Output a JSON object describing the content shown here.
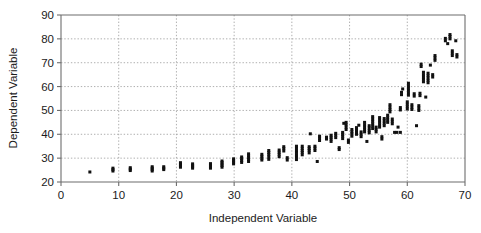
{
  "chart_data": {
    "type": "scatter",
    "title": "",
    "xlabel": "Independent Variable",
    "ylabel": "Dependent Variable",
    "xlim": [
      0,
      70
    ],
    "ylim": [
      20,
      90
    ],
    "xticks": [
      0,
      10,
      20,
      30,
      40,
      50,
      60,
      70
    ],
    "yticks": [
      20,
      30,
      40,
      50,
      60,
      70,
      80,
      90
    ],
    "xtick_labels": [
      "0",
      "10",
      "20",
      "30",
      "40",
      "50",
      "60",
      "70"
    ],
    "ytick_labels": [
      "20",
      "30",
      "40",
      "50",
      "60",
      "70",
      "80",
      "90"
    ],
    "grid": true,
    "grid_style": "dotted",
    "legend": null,
    "marker": "square",
    "marker_color": "#111111",
    "marker_size": 3,
    "series": [
      {
        "name": "observations",
        "points": [
          [
            5.0,
            24.2
          ],
          [
            9.0,
            24.6
          ],
          [
            9.0,
            25.2
          ],
          [
            9.0,
            25.8
          ],
          [
            12.0,
            24.8
          ],
          [
            12.0,
            25.4
          ],
          [
            12.0,
            26.0
          ],
          [
            15.8,
            24.6
          ],
          [
            15.8,
            25.2
          ],
          [
            15.8,
            25.8
          ],
          [
            15.8,
            26.4
          ],
          [
            17.8,
            25.2
          ],
          [
            17.8,
            25.8
          ],
          [
            17.8,
            26.4
          ],
          [
            20.7,
            26.2
          ],
          [
            20.7,
            26.8
          ],
          [
            20.7,
            27.4
          ],
          [
            20.7,
            28.1
          ],
          [
            22.8,
            25.8
          ],
          [
            22.8,
            26.4
          ],
          [
            22.8,
            27.0
          ],
          [
            22.8,
            27.6
          ],
          [
            25.9,
            25.8
          ],
          [
            25.9,
            26.4
          ],
          [
            25.9,
            27.1
          ],
          [
            25.9,
            27.7
          ],
          [
            27.9,
            26.2
          ],
          [
            27.9,
            26.9
          ],
          [
            27.9,
            27.5
          ],
          [
            27.9,
            28.2
          ],
          [
            27.9,
            28.8
          ],
          [
            29.9,
            27.6
          ],
          [
            29.9,
            28.3
          ],
          [
            29.9,
            29.0
          ],
          [
            29.9,
            29.7
          ],
          [
            31.3,
            28.2
          ],
          [
            31.3,
            29.0
          ],
          [
            31.3,
            29.8
          ],
          [
            31.3,
            30.5
          ],
          [
            32.5,
            28.6
          ],
          [
            32.5,
            29.4
          ],
          [
            32.5,
            30.2
          ],
          [
            32.5,
            31.0
          ],
          [
            32.5,
            31.8
          ],
          [
            34.8,
            29.2
          ],
          [
            34.8,
            30.0
          ],
          [
            34.8,
            30.8
          ],
          [
            34.8,
            31.6
          ],
          [
            36.0,
            29.5
          ],
          [
            36.0,
            30.5
          ],
          [
            36.0,
            31.5
          ],
          [
            36.0,
            32.4
          ],
          [
            36.0,
            33.2
          ],
          [
            37.8,
            30.6
          ],
          [
            37.8,
            31.6
          ],
          [
            37.8,
            32.5
          ],
          [
            37.8,
            33.4
          ],
          [
            38.6,
            33.0
          ],
          [
            38.6,
            34.0
          ],
          [
            38.6,
            34.8
          ],
          [
            39.2,
            29.2
          ],
          [
            39.2,
            30.2
          ],
          [
            40.8,
            29.4
          ],
          [
            40.8,
            30.4
          ],
          [
            40.8,
            31.4
          ],
          [
            40.8,
            32.4
          ],
          [
            40.8,
            33.3
          ],
          [
            40.8,
            34.2
          ],
          [
            40.8,
            35.0
          ],
          [
            41.8,
            31.4
          ],
          [
            41.8,
            32.4
          ],
          [
            41.8,
            33.2
          ],
          [
            41.8,
            34.1
          ],
          [
            41.8,
            35.0
          ],
          [
            43.0,
            32.2
          ],
          [
            43.0,
            33.2
          ],
          [
            43.0,
            34.0
          ],
          [
            43.0,
            34.8
          ],
          [
            43.2,
            40.2
          ],
          [
            44.0,
            33.2
          ],
          [
            44.0,
            34.2
          ],
          [
            44.0,
            35.0
          ],
          [
            44.4,
            28.6
          ],
          [
            44.8,
            37.4
          ],
          [
            44.8,
            38.4
          ],
          [
            44.8,
            39.2
          ],
          [
            46.0,
            38.0
          ],
          [
            46.0,
            38.8
          ],
          [
            46.8,
            37.0
          ],
          [
            46.8,
            38.0
          ],
          [
            46.8,
            38.8
          ],
          [
            46.8,
            39.6
          ],
          [
            47.6,
            38.6
          ],
          [
            47.6,
            39.6
          ],
          [
            47.6,
            40.4
          ],
          [
            48.2,
            33.6
          ],
          [
            48.2,
            34.4
          ],
          [
            48.8,
            38.2
          ],
          [
            48.8,
            39.2
          ],
          [
            48.8,
            40.0
          ],
          [
            48.8,
            40.8
          ],
          [
            49.0,
            44.6
          ],
          [
            49.4,
            42.0
          ],
          [
            49.4,
            43.0
          ],
          [
            49.4,
            44.0
          ],
          [
            49.4,
            45.0
          ],
          [
            49.8,
            36.6
          ],
          [
            49.8,
            37.6
          ],
          [
            50.4,
            39.2
          ],
          [
            50.4,
            40.2
          ],
          [
            50.4,
            41.0
          ],
          [
            50.4,
            42.0
          ],
          [
            51.2,
            40.0
          ],
          [
            51.2,
            41.0
          ],
          [
            51.2,
            42.0
          ],
          [
            51.2,
            42.8
          ],
          [
            51.6,
            43.8
          ],
          [
            52.0,
            39.0
          ],
          [
            52.0,
            40.0
          ],
          [
            52.0,
            41.0
          ],
          [
            52.6,
            41.0
          ],
          [
            52.6,
            42.0
          ],
          [
            52.6,
            43.0
          ],
          [
            52.6,
            44.0
          ],
          [
            52.6,
            45.0
          ],
          [
            53.0,
            37.0
          ],
          [
            53.4,
            40.6
          ],
          [
            53.4,
            41.6
          ],
          [
            53.4,
            42.6
          ],
          [
            53.4,
            43.6
          ],
          [
            54.0,
            42.4
          ],
          [
            54.0,
            43.4
          ],
          [
            54.0,
            44.4
          ],
          [
            54.0,
            45.4
          ],
          [
            54.0,
            46.4
          ],
          [
            54.0,
            47.4
          ],
          [
            54.6,
            41.0
          ],
          [
            54.6,
            42.0
          ],
          [
            54.6,
            43.0
          ],
          [
            55.2,
            43.0
          ],
          [
            55.2,
            44.0
          ],
          [
            55.2,
            45.0
          ],
          [
            55.2,
            46.0
          ],
          [
            55.2,
            47.0
          ],
          [
            55.6,
            38.0
          ],
          [
            55.6,
            39.0
          ],
          [
            56.0,
            43.6
          ],
          [
            56.0,
            44.6
          ],
          [
            56.0,
            45.6
          ],
          [
            56.0,
            46.6
          ],
          [
            56.6,
            45.0
          ],
          [
            56.6,
            46.0
          ],
          [
            56.6,
            47.0
          ],
          [
            56.6,
            48.0
          ],
          [
            57.0,
            49.4
          ],
          [
            57.0,
            50.4
          ],
          [
            57.0,
            51.4
          ],
          [
            57.0,
            52.4
          ],
          [
            57.4,
            44.4
          ],
          [
            57.4,
            45.4
          ],
          [
            57.4,
            46.4
          ],
          [
            57.8,
            40.8
          ],
          [
            58.2,
            40.8
          ],
          [
            58.8,
            40.8
          ],
          [
            58.4,
            43.0
          ],
          [
            58.8,
            50.2
          ],
          [
            58.8,
            51.2
          ],
          [
            59.0,
            56.6
          ],
          [
            59.0,
            57.6
          ],
          [
            59.2,
            59.0
          ],
          [
            60.0,
            50.6
          ],
          [
            60.0,
            51.6
          ],
          [
            60.0,
            52.6
          ],
          [
            60.0,
            53.6
          ],
          [
            60.2,
            56.4
          ],
          [
            60.2,
            57.4
          ],
          [
            60.2,
            58.4
          ],
          [
            60.2,
            59.4
          ],
          [
            60.2,
            60.4
          ],
          [
            60.2,
            61.4
          ],
          [
            60.8,
            50.4
          ],
          [
            60.8,
            51.4
          ],
          [
            60.8,
            52.4
          ],
          [
            61.2,
            56.0
          ],
          [
            61.2,
            57.0
          ],
          [
            61.6,
            43.6
          ],
          [
            62.0,
            50.0
          ],
          [
            62.0,
            51.0
          ],
          [
            62.0,
            52.0
          ],
          [
            62.2,
            56.2
          ],
          [
            62.2,
            57.2
          ],
          [
            62.4,
            68.4
          ],
          [
            62.4,
            69.4
          ],
          [
            62.8,
            62.0
          ],
          [
            62.8,
            63.0
          ],
          [
            62.8,
            64.0
          ],
          [
            62.8,
            65.0
          ],
          [
            62.8,
            66.0
          ],
          [
            63.2,
            55.6
          ],
          [
            63.6,
            61.6
          ],
          [
            63.6,
            62.6
          ],
          [
            63.6,
            63.6
          ],
          [
            63.6,
            64.6
          ],
          [
            63.6,
            65.6
          ],
          [
            64.0,
            69.0
          ],
          [
            64.4,
            64.0
          ],
          [
            64.4,
            65.0
          ],
          [
            64.8,
            71.0
          ],
          [
            64.8,
            72.0
          ],
          [
            64.8,
            73.0
          ],
          [
            66.6,
            79.2
          ],
          [
            66.6,
            80.2
          ],
          [
            67.0,
            78.0
          ],
          [
            67.4,
            80.0
          ],
          [
            67.4,
            81.0
          ],
          [
            67.4,
            81.8
          ],
          [
            67.8,
            73.0
          ],
          [
            67.8,
            74.0
          ],
          [
            67.8,
            75.0
          ],
          [
            68.4,
            79.2
          ],
          [
            68.6,
            72.4
          ],
          [
            68.6,
            73.4
          ]
        ]
      }
    ]
  }
}
